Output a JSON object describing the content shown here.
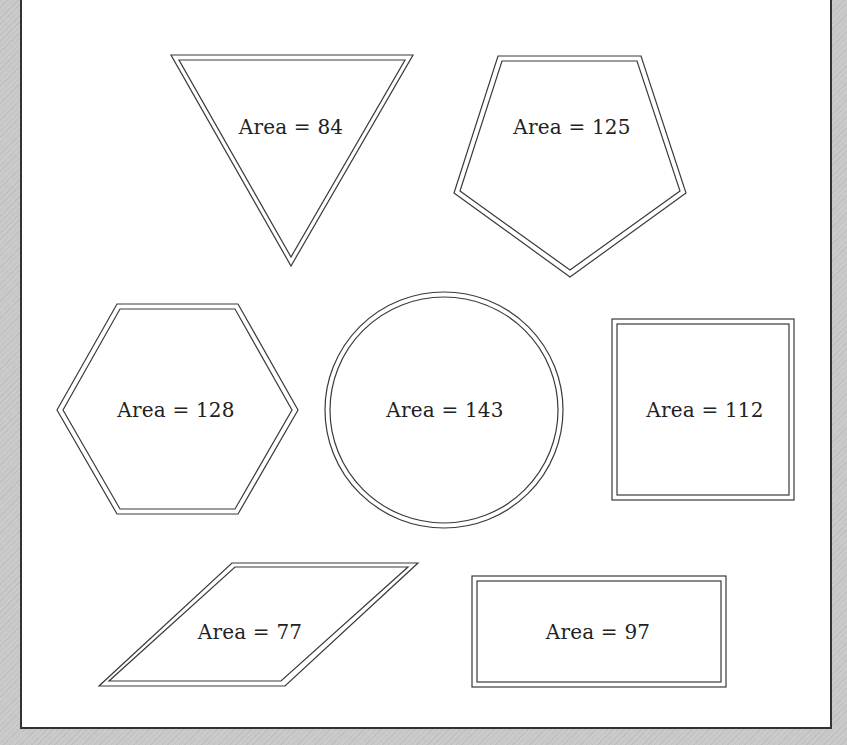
{
  "figure": {
    "type": "area-comparison-shapes",
    "stroke_color": "#3a3a3a",
    "background_color": "#ffffff",
    "shapes": [
      {
        "shape": "inverted-triangle",
        "label": "Area = 84",
        "area": 84
      },
      {
        "shape": "pentagon",
        "label": "Area = 125",
        "area": 125
      },
      {
        "shape": "hexagon",
        "label": "Area = 128",
        "area": 128
      },
      {
        "shape": "circle",
        "label": "Area = 143",
        "area": 143
      },
      {
        "shape": "square",
        "label": "Area = 112",
        "area": 112
      },
      {
        "shape": "parallelogram",
        "label": "Area = 77",
        "area": 77
      },
      {
        "shape": "rectangle",
        "label": "Area = 97",
        "area": 97
      }
    ]
  }
}
